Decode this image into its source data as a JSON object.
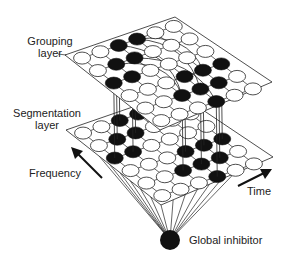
{
  "diagram": {
    "labels": {
      "grouping_layer": [
        "Grouping",
        "layer"
      ],
      "segmentation_layer": [
        "Segmentation",
        "layer"
      ],
      "frequency": "Frequency",
      "time": "Time",
      "global_inhibitor": "Global inhibitor"
    },
    "grid": {
      "rows": 6,
      "cols": 6
    },
    "grouping_layer_active": [
      [
        0,
        0,
        1,
        1,
        0,
        0
      ],
      [
        0,
        1,
        1,
        0,
        0,
        0
      ],
      [
        1,
        1,
        0,
        0,
        0,
        0
      ],
      [
        0,
        0,
        0,
        1,
        1,
        1
      ],
      [
        0,
        0,
        1,
        1,
        1,
        0
      ],
      [
        0,
        0,
        0,
        1,
        0,
        0
      ]
    ],
    "segmentation_layer_active": [
      [
        0,
        0,
        1,
        1,
        0,
        0
      ],
      [
        0,
        1,
        1,
        0,
        0,
        0
      ],
      [
        1,
        1,
        0,
        0,
        0,
        0
      ],
      [
        0,
        0,
        0,
        1,
        1,
        1
      ],
      [
        0,
        0,
        1,
        1,
        1,
        0
      ],
      [
        0,
        0,
        0,
        1,
        0,
        0
      ]
    ],
    "colors": {
      "active": "#111111",
      "inactive": "#ffffff",
      "line": "#222222"
    }
  }
}
